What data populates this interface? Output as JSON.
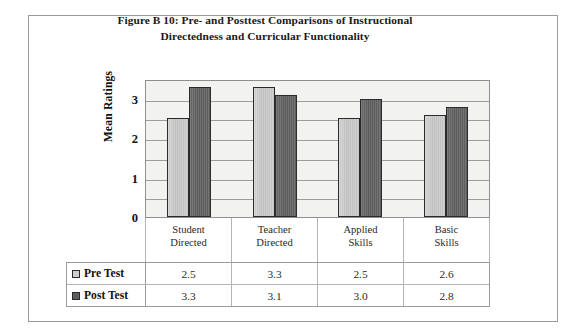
{
  "figure": {
    "title_line1": "Figure B 10: Pre- and Posttest Comparisons of Instructional",
    "title_line2": "Directedness and Curricular Functionality",
    "y_axis_title": "Mean Ratings"
  },
  "colors": {
    "pre_test_bar": "#cccccc",
    "post_test_bar": "#606060",
    "plot_background": "#f2f2f0",
    "gridline": "#9d9d9d",
    "frame_border": "#9a9a9a"
  },
  "chart_data": {
    "type": "bar",
    "title": "Figure B 10: Pre- and Posttest Comparisons of Instructional Directedness and Curricular Functionality",
    "xlabel": "",
    "ylabel": "Mean Ratings",
    "ylim": [
      0,
      3.5
    ],
    "yticks": [
      0,
      1,
      2,
      3
    ],
    "ytick_labels": [
      "0",
      "1",
      "2",
      "3"
    ],
    "minor_gridlines": [
      0.5,
      1.5,
      2.5,
      3.5
    ],
    "grid": true,
    "legend_position": "table-below",
    "categories": [
      [
        "Student",
        "Directed"
      ],
      [
        "Teacher",
        "Directed"
      ],
      [
        "Applied",
        "Skills"
      ],
      [
        "Basic",
        "Skills"
      ]
    ],
    "category_labels": [
      "Student Directed",
      "Teacher Directed",
      "Applied Skills",
      "Basic Skills"
    ],
    "series": [
      {
        "name": "Pre Test",
        "values": [
          2.5,
          3.3,
          2.5,
          2.6
        ],
        "labels": [
          "2.5",
          "3.3",
          "2.5",
          "2.6"
        ]
      },
      {
        "name": "Post Test",
        "values": [
          3.3,
          3.1,
          3.0,
          2.8
        ],
        "labels": [
          "3.3",
          "3.1",
          "3.0",
          "2.8"
        ]
      }
    ]
  }
}
